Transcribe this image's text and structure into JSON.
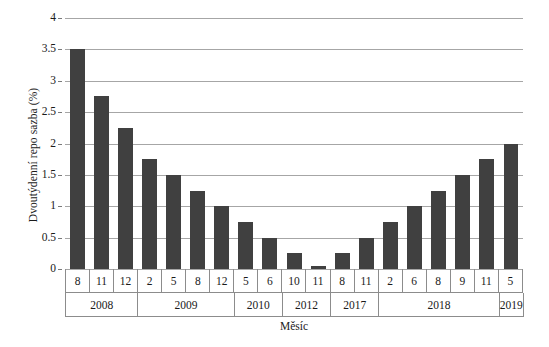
{
  "chart_data": {
    "type": "bar",
    "title": "",
    "xlabel": "Měsíc",
    "ylabel": "Dvoutýdenní repo sazba (%)",
    "ylim": [
      0,
      4
    ],
    "yticks": [
      0,
      0.5,
      1,
      1.5,
      2,
      2.5,
      3,
      3.5,
      4
    ],
    "ytick_labels": [
      "0",
      "0.5",
      "1",
      "1.5",
      "2",
      "2.5",
      "3",
      "3.5",
      "4"
    ],
    "grid": true,
    "legend": "none",
    "categories": [
      "8",
      "11",
      "12",
      "2",
      "5",
      "8",
      "12",
      "5",
      "6",
      "10",
      "11",
      "8",
      "11",
      "2",
      "6",
      "8",
      "9",
      "11",
      "5"
    ],
    "values": [
      3.5,
      2.75,
      2.25,
      1.75,
      1.5,
      1.25,
      1.0,
      0.75,
      0.5,
      0.25,
      0.05,
      0.25,
      0.5,
      0.75,
      1.0,
      1.25,
      1.5,
      1.75,
      2.0
    ],
    "group_label_row": "year",
    "groups": [
      {
        "label": "2008",
        "span": 3,
        "months": [
          "8",
          "11",
          "12"
        ]
      },
      {
        "label": "2009",
        "span": 4,
        "months": [
          "2",
          "5",
          "8",
          "12"
        ]
      },
      {
        "label": "2010",
        "span": 2,
        "months": [
          "5",
          "6"
        ]
      },
      {
        "label": "2012",
        "span": 2,
        "months": [
          "10",
          "11"
        ]
      },
      {
        "label": "2017",
        "span": 2,
        "months": [
          "8",
          "11"
        ]
      },
      {
        "label": "2018",
        "span": 5,
        "months": [
          "2",
          "6",
          "8",
          "9",
          "11"
        ]
      },
      {
        "label": "2019",
        "span": 1,
        "months": [
          "5"
        ]
      }
    ],
    "series": [
      {
        "name": "Dvoutýdenní repo sazba",
        "values": [
          3.5,
          2.75,
          2.25,
          1.75,
          1.5,
          1.25,
          1.0,
          0.75,
          0.5,
          0.25,
          0.05,
          0.25,
          0.5,
          0.75,
          1.0,
          1.25,
          1.5,
          1.75,
          2.0
        ]
      }
    ],
    "colors": {
      "bar": "#404040",
      "gridline": "#a6a6a6",
      "axis_text": "#1a1a1a",
      "table_border": "#8c8c8c",
      "background": "#ffffff"
    }
  }
}
